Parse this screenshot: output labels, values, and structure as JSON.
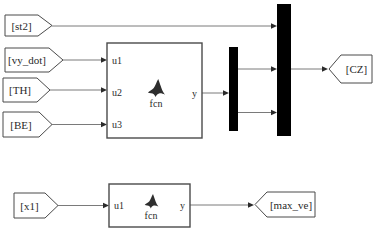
{
  "window": {
    "type": "simulink-model-diagram",
    "background": "#ffffff"
  },
  "colors": {
    "wire": "#7a7a7a",
    "arrowhead": "#2b2b2b",
    "block_border": "#4a4a4a",
    "block_fill": "#ffffff",
    "bar_fill": "#000000",
    "text": "#2a2a2a",
    "logo": "#2e2e2e"
  },
  "from_tags": [
    {
      "label": "[st2]"
    },
    {
      "label": "[vy_dot]"
    },
    {
      "label": "[TH]"
    },
    {
      "label": "[BE]"
    },
    {
      "label": "[x1]"
    }
  ],
  "goto_tags": [
    {
      "label": "[CZ]"
    },
    {
      "label": "[max_ve]"
    }
  ],
  "function_blocks": [
    {
      "label": "fcn",
      "icon": "matlab-logo",
      "input_ports": [
        "u1",
        "u2",
        "u3"
      ],
      "output_ports": [
        "y"
      ]
    },
    {
      "label": "fcn",
      "icon": "matlab-logo",
      "input_ports": [
        "u1"
      ],
      "output_ports": [
        "y"
      ]
    }
  ],
  "bars": [
    {
      "name": "demux"
    },
    {
      "name": "mux"
    }
  ]
}
